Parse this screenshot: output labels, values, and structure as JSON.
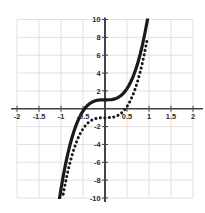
{
  "chart_data": {
    "type": "line",
    "title": "",
    "subtitle": "",
    "xlabel": "",
    "ylabel": "",
    "xlim": [
      -2,
      2
    ],
    "ylim": [
      -10,
      10
    ],
    "grid": true,
    "grid_color": "#d9d9d9",
    "axis_color": "#444444",
    "background": "#ffffff",
    "legend": "none",
    "x_ticks": [
      -2,
      -1.5,
      -1,
      -0.5,
      0.5,
      1,
      1.5,
      2
    ],
    "x_tick_labels": [
      "-2",
      "-1.5",
      "-1",
      "-0.5",
      "0.5",
      "1",
      "1.5",
      "2"
    ],
    "y_ticks": [
      10,
      8,
      6,
      4,
      2,
      -2,
      -4,
      -6,
      -8,
      -10
    ],
    "y_tick_labels": [
      "10",
      "8",
      "6",
      "4",
      "2",
      "-2",
      "-4",
      "-6",
      "-8",
      "-10"
    ],
    "x_minor_gridlines": [
      -2,
      -1.5,
      -1,
      -0.5,
      0,
      0.5,
      1,
      1.5,
      2
    ],
    "y_minor_gridlines": [
      -10,
      -8,
      -6,
      -4,
      -2,
      0,
      2,
      4,
      6,
      8,
      10
    ],
    "series": [
      {
        "name": "solid-cubic",
        "style": "solid",
        "color": "#1a1a1a",
        "width": 3.2,
        "equation": "y = 10x^3 + 1",
        "x": [
          -1.05,
          -1.0,
          -0.95,
          -0.9,
          -0.85,
          -0.8,
          -0.75,
          -0.7,
          -0.65,
          -0.6,
          -0.55,
          -0.5,
          -0.45,
          -0.4,
          -0.35,
          -0.3,
          -0.25,
          -0.2,
          -0.15,
          -0.1,
          -0.05,
          0.0,
          0.05,
          0.1,
          0.15,
          0.2,
          0.25,
          0.3,
          0.35,
          0.4,
          0.45,
          0.5,
          0.55,
          0.6,
          0.65,
          0.7,
          0.75,
          0.8,
          0.85,
          0.9,
          0.95,
          1.0
        ],
        "y": [
          -10.58,
          -9.0,
          -7.57,
          -6.29,
          -5.14,
          -4.12,
          -3.22,
          -2.43,
          -1.75,
          -1.16,
          -0.66,
          -0.25,
          0.09,
          0.36,
          0.57,
          0.73,
          0.84,
          0.92,
          0.97,
          0.99,
          1.0,
          1.0,
          1.0,
          1.01,
          1.03,
          1.08,
          1.16,
          1.27,
          1.43,
          1.64,
          1.91,
          2.25,
          2.66,
          3.16,
          3.75,
          4.43,
          5.22,
          6.12,
          7.14,
          8.29,
          9.57,
          11.0
        ]
      },
      {
        "name": "dotted-cubic",
        "style": "dotted",
        "color": "#1a1a1a",
        "width": 3.0,
        "equation": "y = 10x^3 - 1",
        "x": [
          -0.95,
          -0.9,
          -0.85,
          -0.8,
          -0.75,
          -0.7,
          -0.65,
          -0.6,
          -0.55,
          -0.5,
          -0.45,
          -0.4,
          -0.35,
          -0.3,
          -0.25,
          -0.2,
          -0.15,
          -0.1,
          -0.05,
          0.0,
          0.05,
          0.1,
          0.15,
          0.2,
          0.25,
          0.3,
          0.35,
          0.4,
          0.45,
          0.5,
          0.55,
          0.6,
          0.65,
          0.7,
          0.75,
          0.8,
          0.85,
          0.9,
          0.95
        ],
        "y": [
          -9.57,
          -8.29,
          -7.14,
          -6.12,
          -5.22,
          -4.43,
          -3.75,
          -3.16,
          -2.66,
          -2.25,
          -1.91,
          -1.64,
          -1.43,
          -1.27,
          -1.16,
          -1.08,
          -1.03,
          -1.01,
          -1.0,
          -1.0,
          -1.0,
          -0.99,
          -0.97,
          -0.92,
          -0.84,
          -0.73,
          -0.57,
          -0.36,
          -0.09,
          0.25,
          0.66,
          1.16,
          1.75,
          2.43,
          3.22,
          4.12,
          5.14,
          6.29,
          7.57
        ]
      }
    ]
  }
}
